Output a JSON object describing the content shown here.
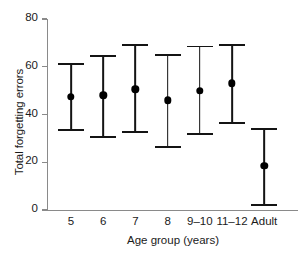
{
  "chart_data": {
    "type": "scatter",
    "title": "",
    "xlabel": "Age group (years)",
    "ylabel": "Total forgetting errors",
    "categories": [
      "5",
      "6",
      "7",
      "8",
      "9–10",
      "11–12",
      "Adult"
    ],
    "values": [
      47.5,
      48.0,
      50.5,
      46.0,
      50.0,
      53.0,
      18.5
    ],
    "error_low": [
      33.5,
      30.5,
      32.5,
      26.5,
      32.0,
      36.5,
      2.0
    ],
    "error_high": [
      61.0,
      64.5,
      69.0,
      65.0,
      68.5,
      69.0,
      34.0
    ],
    "series": [
      {
        "name": "Total forgetting errors",
        "points": [
          {
            "category": "5",
            "value": 47.5,
            "lower": 33.5,
            "upper": 61.0
          },
          {
            "category": "6",
            "value": 48.0,
            "lower": 30.5,
            "upper": 64.5
          },
          {
            "category": "7",
            "value": 50.5,
            "lower": 32.5,
            "upper": 69.0
          },
          {
            "category": "8",
            "value": 46.0,
            "lower": 26.5,
            "upper": 65.0
          },
          {
            "category": "9–10",
            "value": 50.0,
            "lower": 32.0,
            "upper": 68.5
          },
          {
            "category": "11–12",
            "value": 53.0,
            "lower": 36.5,
            "upper": 69.0
          },
          {
            "category": "Adult",
            "value": 18.5,
            "lower": 2.0,
            "upper": 34.0
          }
        ]
      }
    ],
    "ylim": [
      0,
      80
    ],
    "yticks": [
      0,
      20,
      40,
      60,
      80
    ],
    "ytick_labels": [
      "0",
      "20",
      "40",
      "60",
      "80"
    ],
    "grid": false,
    "legend": "none",
    "marker": "filled-circle",
    "marker_color": "#000000",
    "errorbar_color": "#141414",
    "axis_color": "#8a8a8a"
  }
}
